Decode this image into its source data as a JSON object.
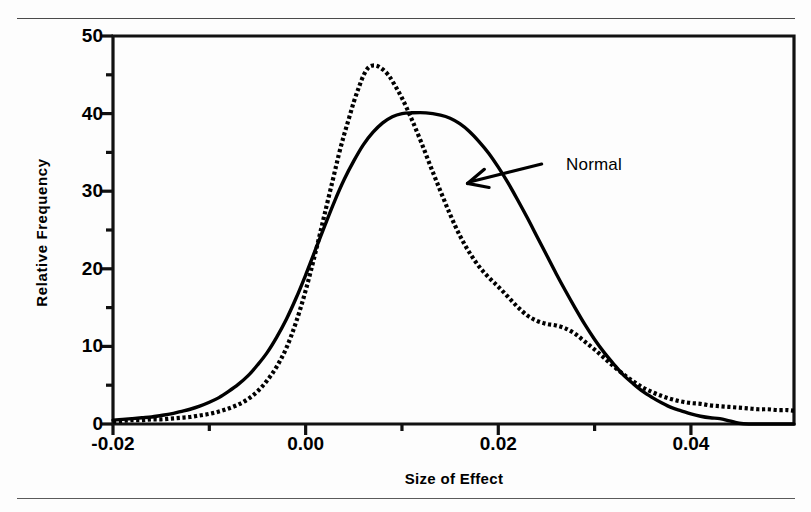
{
  "figure": {
    "has_top_rule": true,
    "has_bottom_rule": true
  },
  "chart_data": {
    "type": "line",
    "title": "",
    "xlabel": "Size of Effect",
    "ylabel": "Relative  Frequency",
    "xlim": [
      -0.02,
      0.0507
    ],
    "ylim": [
      0,
      50
    ],
    "grid": false,
    "legend": "none",
    "x_ticks": [
      {
        "value": -0.02,
        "label": "-0.02"
      },
      {
        "value": 0.0,
        "label": "0.00"
      },
      {
        "value": 0.02,
        "label": "0.02"
      },
      {
        "value": 0.04,
        "label": "0.04"
      }
    ],
    "x_minor_ticks": [
      -0.01,
      0.01,
      0.03
    ],
    "y_ticks": [
      {
        "value": 0,
        "label": "0"
      },
      {
        "value": 10,
        "label": "10"
      },
      {
        "value": 20,
        "label": "20"
      },
      {
        "value": 30,
        "label": "30"
      },
      {
        "value": 40,
        "label": "40"
      },
      {
        "value": 50,
        "label": "50"
      }
    ],
    "y_minor_ticks": [
      5,
      15,
      25,
      35,
      45
    ],
    "annotations": [
      {
        "text": "Normal",
        "points_to_series": "Normal",
        "x": 0.0245,
        "y": 33.5,
        "arrow_tip_x": 0.0168,
        "arrow_tip_y": 31.0
      }
    ],
    "series": [
      {
        "name": "Normal",
        "style": "solid",
        "color": "#000000",
        "peak_x": 0.0125,
        "peak_y": 40.1,
        "points": [
          [
            -0.02,
            0.5
          ],
          [
            -0.019,
            0.6
          ],
          [
            -0.018,
            0.7
          ],
          [
            -0.017,
            0.8
          ],
          [
            -0.016,
            0.9
          ],
          [
            -0.015,
            1.1
          ],
          [
            -0.014,
            1.3
          ],
          [
            -0.013,
            1.6
          ],
          [
            -0.012,
            1.9
          ],
          [
            -0.011,
            2.3
          ],
          [
            -0.01,
            2.8
          ],
          [
            -0.009,
            3.4
          ],
          [
            -0.008,
            4.2
          ],
          [
            -0.007,
            5.1
          ],
          [
            -0.006,
            6.2
          ],
          [
            -0.005,
            7.6
          ],
          [
            -0.004,
            9.2
          ],
          [
            -0.003,
            11.2
          ],
          [
            -0.002,
            13.5
          ],
          [
            -0.001,
            16.2
          ],
          [
            0.0,
            19.2
          ],
          [
            0.001,
            22.4
          ],
          [
            0.002,
            25.6
          ],
          [
            0.003,
            28.7
          ],
          [
            0.004,
            31.5
          ],
          [
            0.005,
            33.9
          ],
          [
            0.006,
            36.0
          ],
          [
            0.007,
            37.6
          ],
          [
            0.008,
            38.8
          ],
          [
            0.009,
            39.6
          ],
          [
            0.01,
            40.0
          ],
          [
            0.011,
            40.1
          ],
          [
            0.0125,
            40.1
          ],
          [
            0.014,
            39.8
          ],
          [
            0.015,
            39.4
          ],
          [
            0.016,
            38.7
          ],
          [
            0.017,
            37.7
          ],
          [
            0.018,
            36.4
          ],
          [
            0.019,
            34.9
          ],
          [
            0.02,
            33.1
          ],
          [
            0.021,
            31.1
          ],
          [
            0.022,
            28.9
          ],
          [
            0.023,
            26.6
          ],
          [
            0.024,
            24.2
          ],
          [
            0.025,
            21.8
          ],
          [
            0.026,
            19.4
          ],
          [
            0.027,
            17.1
          ],
          [
            0.028,
            14.9
          ],
          [
            0.029,
            12.8
          ],
          [
            0.03,
            10.9
          ],
          [
            0.031,
            9.2
          ],
          [
            0.032,
            7.7
          ],
          [
            0.033,
            6.3
          ],
          [
            0.034,
            5.2
          ],
          [
            0.035,
            4.2
          ],
          [
            0.036,
            3.4
          ],
          [
            0.037,
            2.7
          ],
          [
            0.038,
            2.1
          ],
          [
            0.039,
            1.7
          ],
          [
            0.04,
            1.3
          ],
          [
            0.041,
            1.0
          ],
          [
            0.042,
            0.8
          ],
          [
            0.043,
            0.7
          ],
          [
            0.044,
            0.4
          ],
          [
            0.045,
            0.1
          ],
          [
            0.046,
            0.0
          ],
          [
            0.048,
            0.0
          ],
          [
            0.0507,
            0.0
          ]
        ]
      },
      {
        "name": "Observed",
        "style": "dotted",
        "color": "#000000",
        "peak_x": 0.0067,
        "peak_y": 46.2,
        "points": [
          [
            -0.02,
            0.3
          ],
          [
            -0.019,
            0.4
          ],
          [
            -0.018,
            0.5
          ],
          [
            -0.017,
            0.5
          ],
          [
            -0.016,
            0.6
          ],
          [
            -0.015,
            0.6
          ],
          [
            -0.014,
            0.7
          ],
          [
            -0.013,
            0.8
          ],
          [
            -0.012,
            0.9
          ],
          [
            -0.011,
            1.1
          ],
          [
            -0.01,
            1.3
          ],
          [
            -0.009,
            1.6
          ],
          [
            -0.008,
            2.0
          ],
          [
            -0.007,
            2.5
          ],
          [
            -0.006,
            3.2
          ],
          [
            -0.005,
            4.2
          ],
          [
            -0.004,
            5.6
          ],
          [
            -0.003,
            7.4
          ],
          [
            -0.002,
            9.8
          ],
          [
            -0.001,
            13.1
          ],
          [
            0.0,
            17.2
          ],
          [
            0.001,
            22.0
          ],
          [
            0.002,
            27.2
          ],
          [
            0.003,
            32.4
          ],
          [
            0.0035,
            35.0
          ],
          [
            0.004,
            37.3
          ],
          [
            0.0045,
            39.4
          ],
          [
            0.005,
            41.5
          ],
          [
            0.0055,
            43.3
          ],
          [
            0.006,
            44.9
          ],
          [
            0.0065,
            45.9
          ],
          [
            0.007,
            46.2
          ],
          [
            0.0075,
            46.1
          ],
          [
            0.008,
            45.7
          ],
          [
            0.0085,
            45.1
          ],
          [
            0.009,
            44.2
          ],
          [
            0.01,
            42.0
          ],
          [
            0.011,
            39.3
          ],
          [
            0.012,
            36.3
          ],
          [
            0.013,
            33.1
          ],
          [
            0.014,
            30.0
          ],
          [
            0.015,
            27.0
          ],
          [
            0.016,
            24.3
          ],
          [
            0.017,
            22.1
          ],
          [
            0.018,
            20.3
          ],
          [
            0.019,
            18.9
          ],
          [
            0.02,
            17.7
          ],
          [
            0.021,
            16.4
          ],
          [
            0.022,
            15.1
          ],
          [
            0.023,
            14.0
          ],
          [
            0.024,
            13.3
          ],
          [
            0.025,
            12.9
          ],
          [
            0.026,
            12.7
          ],
          [
            0.027,
            12.3
          ],
          [
            0.028,
            11.6
          ],
          [
            0.029,
            10.6
          ],
          [
            0.03,
            9.6
          ],
          [
            0.031,
            8.5
          ],
          [
            0.032,
            7.4
          ],
          [
            0.033,
            6.4
          ],
          [
            0.034,
            5.5
          ],
          [
            0.035,
            4.7
          ],
          [
            0.036,
            4.1
          ],
          [
            0.037,
            3.6
          ],
          [
            0.038,
            3.2
          ],
          [
            0.039,
            2.9
          ],
          [
            0.04,
            2.7
          ],
          [
            0.041,
            2.6
          ],
          [
            0.042,
            2.4
          ],
          [
            0.043,
            2.3
          ],
          [
            0.044,
            2.2
          ],
          [
            0.045,
            2.1
          ],
          [
            0.046,
            2.0
          ],
          [
            0.047,
            1.9
          ],
          [
            0.048,
            1.9
          ],
          [
            0.049,
            1.8
          ],
          [
            0.05,
            1.8
          ],
          [
            0.0507,
            1.7
          ]
        ]
      }
    ]
  }
}
